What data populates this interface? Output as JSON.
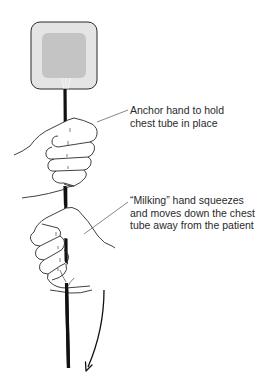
{
  "figure": {
    "colors": {
      "dressing_outer": "#e4e4e4",
      "dressing_inner": "#c4c4c4",
      "outline": "#2a2a2a",
      "tube": "#111111",
      "leader": "#555555"
    }
  },
  "labels": {
    "anchor": {
      "lines": [
        "Anchor hand to hold",
        "chest tube in place"
      ]
    },
    "milking": {
      "lines": [
        "“Milking” hand squeezes",
        "and moves down the chest",
        "tube away from the patient"
      ]
    }
  },
  "icons": {
    "arrow": "down-arrow-curved"
  }
}
